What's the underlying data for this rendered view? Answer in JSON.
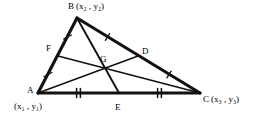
{
  "figure": {
    "stroke_color": "#000000",
    "background_color": "#ffffff",
    "width": 257,
    "height": 119
  },
  "vertices": {
    "B": {
      "label": "B",
      "coord_open": "(x",
      "coord_sub1": "2",
      "coord_mid": ", y",
      "coord_sub2": "2",
      "coord_close": ")",
      "full": "B (x2, y2)",
      "x": 77,
      "y": 18
    },
    "A": {
      "label": "A",
      "coord_open": "(x",
      "coord_sub1": "1",
      "coord_mid": ", y",
      "coord_sub2": "1",
      "coord_close": ")",
      "full": "A (x1, y1)",
      "x": 38,
      "y": 93
    },
    "C": {
      "label": "C",
      "coord_open": "(x",
      "coord_sub1": "3",
      "coord_mid": ", y",
      "coord_sub2": "3",
      "coord_close": ")",
      "full": "C (x3, y3)",
      "x": 200,
      "y": 93
    }
  },
  "labels": {
    "B_vertex": "B",
    "B_coord": "(x₂ , y₂)",
    "A_vertex": "A",
    "A_coord": "(x₁ , y₁)",
    "C_vertex": "C",
    "C_coord": "(x₃ , y₃)",
    "F": "F",
    "D": "D",
    "G": "G",
    "E": "E"
  },
  "midpoints": {
    "F": {
      "label": "F",
      "of_segment": "AB",
      "x": 58,
      "y": 56
    },
    "D": {
      "label": "D",
      "of_segment": "BC",
      "x": 138,
      "y": 56
    },
    "E": {
      "label": "E",
      "of_segment": "AC",
      "x": 119,
      "y": 93
    }
  },
  "centroid": {
    "label": "G",
    "x": 105,
    "y": 66
  },
  "medians": [
    {
      "name": "median-A-to-D",
      "from": "A",
      "to": "D"
    },
    {
      "name": "median-B-to-E",
      "from": "B",
      "to": "E"
    },
    {
      "name": "median-C-to-F",
      "from": "C",
      "to": "F"
    }
  ],
  "sides": [
    {
      "name": "side-AB",
      "from": "A",
      "to": "B",
      "tick_count": 1
    },
    {
      "name": "side-BC",
      "from": "B",
      "to": "C",
      "tick_count": 1
    },
    {
      "name": "side-AC",
      "from": "A",
      "to": "C",
      "tick_count": 2
    }
  ],
  "tick_marks": {
    "AF": 1,
    "FB": 1,
    "BD": 1,
    "DC": 1,
    "AE": 2,
    "EC": 2
  }
}
